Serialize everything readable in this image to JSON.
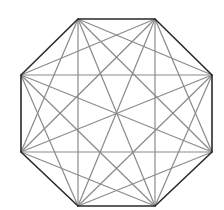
{
  "diagram": {
    "type": "complete-graph-octagon",
    "vertex_count": 8,
    "vertices": [
      {
        "id": "v0",
        "x": 78,
        "y": 19
      },
      {
        "id": "v1",
        "x": 155,
        "y": 19
      },
      {
        "id": "v2",
        "x": 212,
        "y": 75
      },
      {
        "id": "v3",
        "x": 212,
        "y": 152
      },
      {
        "id": "v4",
        "x": 155,
        "y": 206
      },
      {
        "id": "v5",
        "x": 78,
        "y": 206
      },
      {
        "id": "v6",
        "x": 21,
        "y": 152
      },
      {
        "id": "v7",
        "x": 21,
        "y": 75
      }
    ],
    "colors": {
      "edge": "#2a2a2a",
      "diagonal": "#8a8a8a",
      "background": "#ffffff"
    }
  }
}
